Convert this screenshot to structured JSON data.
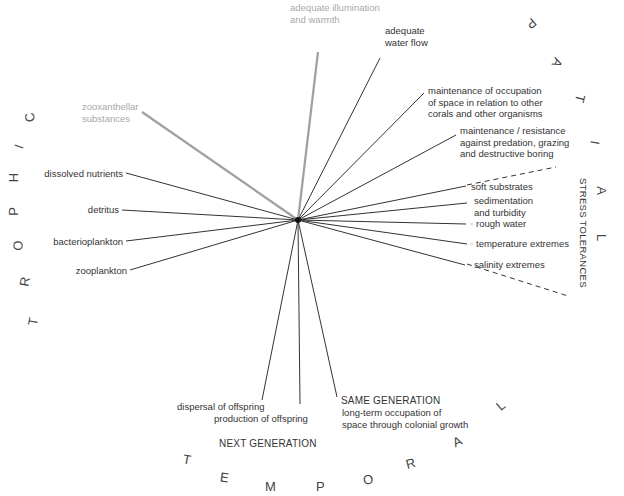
{
  "hub": {
    "x": 298,
    "y": 220
  },
  "colors": {
    "line": "#333333",
    "gray_line": "#a0a0a0",
    "gray_text": "#a8a8a8",
    "background": "#ffffff"
  },
  "spokes": [
    {
      "id": "illumination",
      "end": [
        318,
        52
      ],
      "style": "gray-thick"
    },
    {
      "id": "water-flow",
      "end": [
        380,
        58
      ],
      "style": "solid"
    },
    {
      "id": "occupation",
      "end": [
        424,
        93
      ],
      "style": "solid"
    },
    {
      "id": "predation",
      "end": [
        456,
        135
      ],
      "style": "solid"
    },
    {
      "id": "soft-substrates",
      "end": [
        466,
        186
      ],
      "style": "solid"
    },
    {
      "id": "sedimentation",
      "end": [
        467,
        203
      ],
      "style": "solid"
    },
    {
      "id": "rough-water",
      "end": [
        466,
        224
      ],
      "style": "solid"
    },
    {
      "id": "temperature",
      "end": [
        467,
        244
      ],
      "style": "solid"
    },
    {
      "id": "salinity",
      "end": [
        465,
        265
      ],
      "style": "solid"
    },
    {
      "id": "zooxanthellar",
      "end": [
        142,
        112
      ],
      "style": "gray-thick"
    },
    {
      "id": "dissolved-nutrients",
      "end": [
        126,
        173
      ],
      "style": "solid"
    },
    {
      "id": "detritus",
      "end": [
        122,
        210
      ],
      "style": "solid"
    },
    {
      "id": "bacterioplankton",
      "end": [
        126,
        241
      ],
      "style": "solid"
    },
    {
      "id": "zooplankton",
      "end": [
        130,
        270
      ],
      "style": "solid"
    },
    {
      "id": "dispersal",
      "end": [
        262,
        400
      ],
      "style": "solid"
    },
    {
      "id": "production",
      "end": [
        300,
        404
      ],
      "style": "solid"
    },
    {
      "id": "same-generation",
      "end": [
        337,
        397
      ],
      "style": "solid"
    }
  ],
  "dashed_lines": [
    {
      "from": [
        467,
        185
      ],
      "to": [
        556,
        167
      ]
    },
    {
      "from": [
        467,
        264
      ],
      "to": [
        568,
        296
      ]
    }
  ],
  "labels": {
    "illumination": [
      "adequate illumination",
      "and warmth"
    ],
    "water_flow": [
      "adequate",
      "water flow"
    ],
    "occupation": [
      "maintenance of occupation",
      "of space in relation to other",
      "corals and other organisms"
    ],
    "predation": [
      "maintenance / resistance",
      "against predation, grazing",
      "and destructive boring"
    ],
    "soft_substrates": "soft substrates",
    "sedimentation": [
      "sedimentation",
      "and turbidity"
    ],
    "rough_water": "rough water",
    "temperature": "temperature extremes",
    "salinity": "salinity extremes",
    "zooxanthellar": [
      "zooxanthellar",
      "substances"
    ],
    "dissolved_nutrients": "dissolved nutrients",
    "detritus": "detritus",
    "bacterioplankton": "bacterioplankton",
    "zooplankton": "zooplankton",
    "dispersal": "dispersal of offspring",
    "production": "production of offspring",
    "same_generation_title": "SAME GENERATION",
    "same_generation": [
      "long-term occupation of",
      "space through colonial growth"
    ],
    "next_generation": "NEXT GENERATION",
    "stress_tolerances": "STRESS TOLERANCES"
  },
  "arc_words": {
    "trophic": [
      {
        "ch": "T",
        "x": 34,
        "y": 322,
        "rot": -80
      },
      {
        "ch": "R",
        "x": 25,
        "y": 282,
        "rot": -80
      },
      {
        "ch": "O",
        "x": 18,
        "y": 246,
        "rot": -85
      },
      {
        "ch": "P",
        "x": 14,
        "y": 212,
        "rot": -90
      },
      {
        "ch": "H",
        "x": 14,
        "y": 178,
        "rot": -90
      },
      {
        "ch": "I",
        "x": 22,
        "y": 147,
        "rot": -70
      },
      {
        "ch": "C",
        "x": 30,
        "y": 118,
        "rot": -100
      }
    ],
    "spatial": [
      {
        "ch": "P",
        "x": 532,
        "y": 24,
        "rot": 140
      },
      {
        "ch": "A",
        "x": 558,
        "y": 63,
        "rot": 115
      },
      {
        "ch": "T",
        "x": 581,
        "y": 99,
        "rot": 105
      },
      {
        "ch": "I",
        "x": 598,
        "y": 143,
        "rot": 100
      },
      {
        "ch": "A",
        "x": 602,
        "y": 191,
        "rot": 90
      },
      {
        "ch": "L",
        "x": 603,
        "y": 238,
        "rot": 90
      }
    ],
    "temporal": [
      {
        "ch": "T",
        "x": 188,
        "y": 460,
        "rot": 10
      },
      {
        "ch": "E",
        "x": 225,
        "y": 478,
        "rot": 8
      },
      {
        "ch": "M",
        "x": 270,
        "y": 487,
        "rot": 0
      },
      {
        "ch": "P",
        "x": 321,
        "y": 487,
        "rot": 0
      },
      {
        "ch": "O",
        "x": 368,
        "y": 480,
        "rot": -8
      },
      {
        "ch": "R",
        "x": 411,
        "y": 464,
        "rot": -15
      },
      {
        "ch": "A",
        "x": 458,
        "y": 442,
        "rot": -25
      },
      {
        "ch": "L",
        "x": 502,
        "y": 406,
        "rot": -40
      }
    ]
  }
}
